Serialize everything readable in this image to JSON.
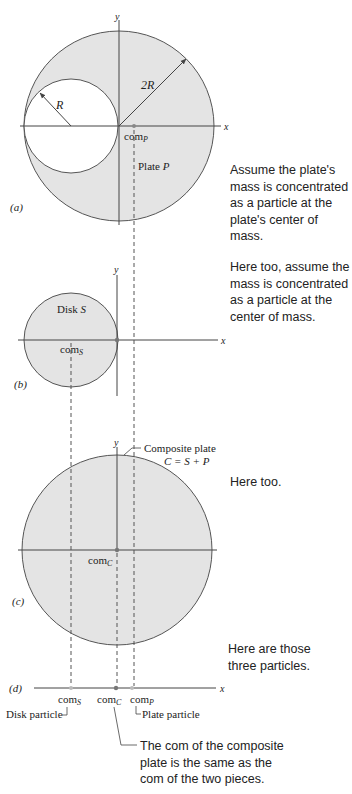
{
  "colors": {
    "plate_fill": "#e4e4e4",
    "outline": "#555555",
    "axis": "#444444",
    "text": "#222222",
    "background": "#ffffff"
  },
  "panel_a": {
    "label": "(a)",
    "x_axis": "x",
    "y_axis": "y",
    "small_radius": "R",
    "big_radius": "2R",
    "com_base": "com",
    "com_sub": "P",
    "plate_label": "Plate ",
    "plate_var": "P"
  },
  "panel_b": {
    "label": "(b)",
    "x_axis": "x",
    "y_axis": "y",
    "disk_label": "Disk ",
    "disk_var": "S",
    "com_base": "com",
    "com_sub": "S"
  },
  "panel_c": {
    "label": "(c)",
    "x_axis": "x",
    "y_axis": "y",
    "callout_line1": "Composite plate",
    "callout_line2": "C = S + P",
    "com_base": "com",
    "com_sub": "C"
  },
  "panel_d": {
    "label": "(d)",
    "x_axis": "x",
    "com_s_base": "com",
    "com_s_sub": "S",
    "com_c_base": "com",
    "com_c_sub": "C",
    "com_p_base": "com",
    "com_p_sub": "P",
    "disk_particle": "Disk particle",
    "plate_particle": "Plate particle"
  },
  "notes": {
    "a": "Assume the plate's mass is concentrated as a particle at the plate's center of mass.",
    "b": "Here too, assume the mass is concentrated as a particle at the center of mass.",
    "c": "Here too.",
    "d": "Here are those three particles.",
    "e": "The com of the composite plate is the same as the com of the two pieces."
  }
}
